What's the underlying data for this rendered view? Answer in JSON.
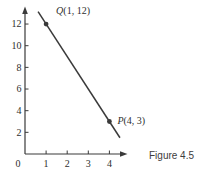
{
  "figure": {
    "caption": "Figure 4.5"
  },
  "chart_data": {
    "type": "line",
    "title": "",
    "xlabel": "",
    "ylabel": "",
    "origin_label": "0",
    "x_ticks": [
      1,
      2,
      3,
      4
    ],
    "y_ticks": [
      2,
      4,
      6,
      8,
      10,
      12
    ],
    "xlim": [
      0,
      4.8
    ],
    "ylim": [
      0,
      13.6
    ],
    "grid": false,
    "points": [
      {
        "letter": "Q",
        "coords": "(1, 12)",
        "x": 1,
        "y": 12,
        "label_dx": 10,
        "label_dy": -10
      },
      {
        "letter": "P",
        "coords": "(4, 3)",
        "x": 4,
        "y": 3,
        "label_dx": 8,
        "label_dy": 2
      }
    ],
    "segment": {
      "x1": 0.62,
      "y1": 13.14,
      "x2": 4.5,
      "y2": 1.5
    },
    "line_equation": "y = -3x + 15",
    "colors": {
      "line": "#3a3a3a",
      "axis": "#3a3a3a",
      "text": "#2e2e2e",
      "caption": "#3d3d3d",
      "background": "#ffffff"
    }
  }
}
